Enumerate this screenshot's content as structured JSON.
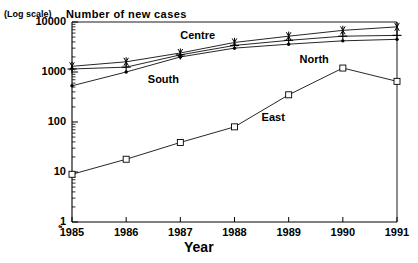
{
  "header": {
    "log_note": "(Log scale)",
    "title": "Number of new cases"
  },
  "axes": {
    "x_title": "Year",
    "y_ticks": [
      "10000",
      "1000",
      "100",
      "10",
      "1"
    ],
    "x_ticks": [
      "1985",
      "1986",
      "1987",
      "1988",
      "1989",
      "1990",
      "1991"
    ],
    "origin_marker": "‹▪"
  },
  "series_labels": {
    "centre": "Centre",
    "south": "South",
    "north": "North",
    "east": "East"
  },
  "colors": {
    "line": "#000000",
    "background": "#ffffff",
    "axis": "#000000"
  },
  "chart_data": {
    "type": "line",
    "title": "Number of new cases",
    "subtitle": "(Log scale)",
    "xlabel": "Year",
    "ylabel": "Number of new cases",
    "x": [
      1985,
      1986,
      1987,
      1988,
      1989,
      1990,
      1991
    ],
    "xticklabels": [
      "1985",
      "1986",
      "1987",
      "1988",
      "1989",
      "1990",
      "1991"
    ],
    "yscale": "log",
    "ylim": [
      1,
      10000
    ],
    "yticks": [
      1,
      10,
      100,
      1000,
      10000
    ],
    "yticklabels": [
      "1",
      "10",
      "100",
      "1000",
      "10000"
    ],
    "grid": false,
    "legend": "inline-annotations",
    "minor_ticks": true,
    "series": [
      {
        "name": "Centre",
        "marker": "asterisk",
        "values": [
          1300,
          1600,
          2400,
          3900,
          5200,
          6800,
          8000
        ]
      },
      {
        "name": "South",
        "marker": "plus",
        "values": [
          1150,
          1250,
          2200,
          3400,
          4300,
          5200,
          5400
        ]
      },
      {
        "name": "North",
        "marker": "dot",
        "values": [
          530,
          1000,
          2000,
          3000,
          3600,
          4200,
          4500
        ]
      },
      {
        "name": "East",
        "marker": "square",
        "values": [
          9,
          18,
          39,
          80,
          350,
          1200,
          650
        ]
      }
    ],
    "annotations": [
      {
        "text": "Centre",
        "x": 1987.0,
        "y": 5200
      },
      {
        "text": "South",
        "x": 1986.4,
        "y": 700
      },
      {
        "text": "North",
        "x": 1989.2,
        "y": 1750
      },
      {
        "text": "East",
        "x": 1988.5,
        "y": 120
      }
    ]
  }
}
